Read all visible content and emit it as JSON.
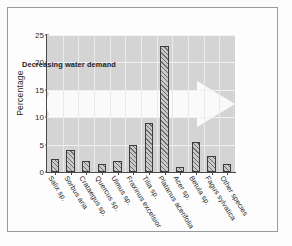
{
  "figure": {
    "border_color": "#9a9a9a",
    "page_background": "#fcfcfc"
  },
  "chart_data": {
    "type": "bar",
    "title": "",
    "xlabel": "",
    "ylabel": "Percentage",
    "ylim": [
      0,
      25
    ],
    "yticks": [
      0,
      5,
      10,
      15,
      20,
      25
    ],
    "grid": true,
    "legend": "none",
    "plot_background": "#d4d4d4",
    "gridline_color": "#f2f2f2",
    "bar_fill": "#9e9e9e",
    "bar_edge": "#3c3c3c",
    "bar_hatch": "diagonal",
    "categories": [
      "Salix sp.",
      "Sorbus aria",
      "Crataegus sp.",
      "Quercus sp.",
      "Ulmus sp.",
      "Fraxinus excelsior",
      "Tilia sp.",
      "Platanus acerifolia",
      "Acer sp.",
      "Betula sp.",
      "Fagus sylvatica",
      "Other species"
    ],
    "values": [
      2.4,
      4.0,
      2.0,
      1.5,
      2.0,
      5.0,
      9.0,
      23.0,
      1.0,
      5.5,
      3.0,
      1.5
    ],
    "annotations": [
      {
        "name": "decreasing-water-demand-arrow",
        "text": "Decreasing water demand",
        "direction": "right",
        "color": "#ffffff",
        "text_color": "#1e1e1e"
      }
    ]
  }
}
